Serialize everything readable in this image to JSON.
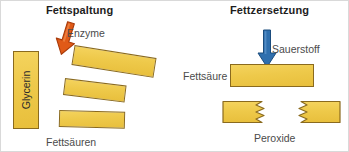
{
  "diagram": {
    "width": 349,
    "height": 152,
    "background": "#ffffff",
    "frame_color": "#d9d9d9"
  },
  "colors": {
    "bar_fill": "#eec94a",
    "bar_fill_light": "#f4d35e",
    "bar_fill_dark": "#e8bf3c",
    "bar_outline": "#8a6a1e",
    "enzyme_arrow": "#e05a17",
    "enzyme_arrow_dark": "#b8410b",
    "oxygen_arrow": "#2f6fae",
    "oxygen_arrow_dark": "#1e5286",
    "title_text": "#1d1d1d",
    "label_text": "#4b4b4b"
  },
  "panels": [
    {
      "id": "fat-cleavage",
      "title": "Fettspaltung",
      "arrow": {
        "name": "enzyme-arrow",
        "label": "Enzyme",
        "direction": "down",
        "color": "#e05a17",
        "tilt_degrees": 18
      },
      "blocks": [
        {
          "name": "glycerin-block",
          "label": "Glycerin",
          "orientation": "vertical"
        },
        {
          "name": "fatty-acid-bar-1",
          "label": "",
          "orientation": "tilted",
          "tilt_degrees": 9
        },
        {
          "name": "fatty-acid-bar-2",
          "label": "",
          "orientation": "tilted",
          "tilt_degrees": 7
        },
        {
          "name": "fatty-acid-bar-3",
          "label": "",
          "orientation": "tilted",
          "tilt_degrees": 1.5
        }
      ],
      "caption": "Fettsäuren"
    },
    {
      "id": "fat-decomposition",
      "title": "Fettzersetzung",
      "arrow": {
        "name": "oxygen-arrow",
        "label": "Sauerstoff",
        "direction": "down",
        "color": "#2f6fae",
        "tilt_degrees": 0
      },
      "blocks": [
        {
          "name": "fatty-acid-block",
          "label": "Fettsäure",
          "orientation": "horizontal"
        },
        {
          "name": "peroxide-fragment-left",
          "label": "",
          "orientation": "horizontal-torn"
        },
        {
          "name": "peroxide-fragment-right",
          "label": "",
          "orientation": "horizontal-torn"
        }
      ],
      "caption": "Peroxide"
    }
  ],
  "labels": {
    "title_left": "Fettspaltung",
    "title_right": "Fettzersetzung",
    "enzyme": "Enzyme",
    "glycerin": "Glycerin",
    "fettsaeuren": "Fettsäuren",
    "sauerstoff": "Sauerstoff",
    "fettsaeure": "Fettsäure",
    "peroxide": "Peroxide"
  }
}
